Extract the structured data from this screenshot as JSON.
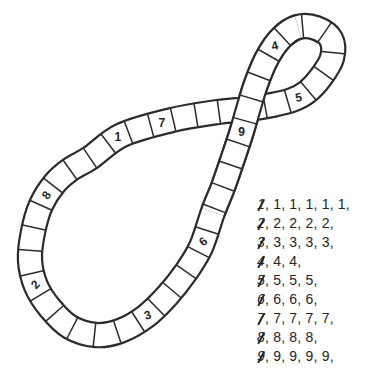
{
  "track": {
    "cell_numbers": [
      "1",
      "2",
      "3",
      "4",
      "5",
      "6",
      "7",
      "8",
      "9"
    ]
  },
  "sequence_list": {
    "rows": [
      {
        "crossed": "1",
        "items": [
          "1",
          "1",
          "1",
          "1",
          "1"
        ]
      },
      {
        "crossed": "2",
        "items": [
          "2",
          "2",
          "2",
          "2"
        ]
      },
      {
        "crossed": "3",
        "items": [
          "3",
          "3",
          "3",
          "3"
        ]
      },
      {
        "crossed": "4",
        "items": [
          "4",
          "4"
        ]
      },
      {
        "crossed": "5",
        "items": [
          "5",
          "5",
          "5"
        ]
      },
      {
        "crossed": "6",
        "items": [
          "6",
          "6",
          "6"
        ]
      },
      {
        "crossed": "7",
        "items": [
          "7",
          "7",
          "7",
          "7"
        ]
      },
      {
        "crossed": "8",
        "items": [
          "8",
          "8",
          "8"
        ]
      },
      {
        "crossed": "9",
        "items": [
          "9",
          "9",
          "9",
          "9"
        ]
      }
    ]
  },
  "colors": {
    "line": "#2b2b2b",
    "text": "#262626",
    "background": "#ffffff"
  }
}
